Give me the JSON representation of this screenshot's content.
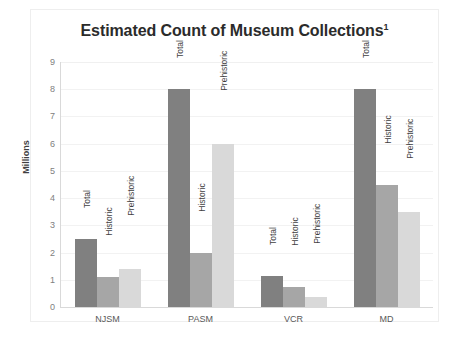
{
  "chart_data": {
    "type": "bar",
    "title": "Estimated Count of Museum Collections",
    "title_superscript": "1",
    "xlabel": "",
    "ylabel": "Millions",
    "ylim": [
      0,
      9
    ],
    "ytick_values": [
      0,
      1,
      2,
      3,
      4,
      5,
      6,
      7,
      8,
      9
    ],
    "ytick_labels": [
      "0",
      "1",
      "2",
      "3",
      "4",
      "5",
      "6",
      "7",
      "8",
      "9"
    ],
    "grid": true,
    "legend_position": "none",
    "categories": [
      "NJSM",
      "PASM",
      "VCR",
      "MD"
    ],
    "series": [
      {
        "name": "Total",
        "color": "#808080",
        "values": [
          2.5,
          8.0,
          1.15,
          8.0
        ]
      },
      {
        "name": "Historic",
        "color": "#a6a6a6",
        "values": [
          1.1,
          2.0,
          0.75,
          4.5
        ]
      },
      {
        "name": "Prehistoric",
        "color": "#d9d9d9",
        "values": [
          1.4,
          6.0,
          0.35,
          3.5
        ]
      }
    ],
    "bar_labels": [
      [
        "Total",
        "Historic",
        "Prehistoric"
      ],
      [
        "Total",
        "Historic",
        "Prehistoric"
      ],
      [
        "Total",
        "Historic",
        "Prehistoric"
      ],
      [
        "Total",
        "Historic",
        "Prehistoric"
      ]
    ]
  }
}
